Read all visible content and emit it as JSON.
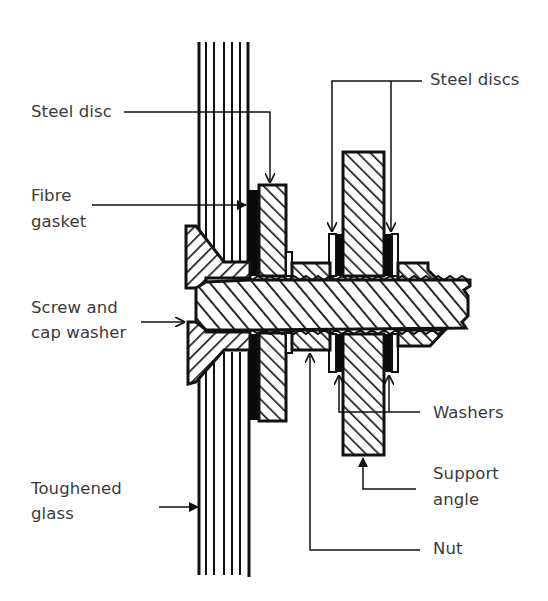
{
  "diagram": {
    "type": "engineering cross-section",
    "colors": {
      "ink": "#111111",
      "text": "#3a3a3a",
      "background": "#ffffff",
      "hatch": "#111111",
      "gasket": "#0a0a0a"
    }
  },
  "labels": {
    "steel_disc": "Steel disc",
    "fibre_gasket_1": "Fibre",
    "fibre_gasket_2": "gasket",
    "screw_1": "Screw and",
    "screw_2": "cap washer",
    "glass_1": "Toughened",
    "glass_2": "glass",
    "steel_discs": "Steel discs",
    "washers": "Washers",
    "support_1": "Support",
    "support_2": "angle",
    "nut": "Nut"
  },
  "components": [
    {
      "id": "toughened-glass",
      "name": "Toughened glass"
    },
    {
      "id": "screw-cap-washer",
      "name": "Screw and cap washer"
    },
    {
      "id": "fibre-gasket",
      "name": "Fibre gasket"
    },
    {
      "id": "steel-disc",
      "name": "Steel disc"
    },
    {
      "id": "nut",
      "name": "Nut"
    },
    {
      "id": "steel-discs",
      "name": "Steel discs"
    },
    {
      "id": "washers",
      "name": "Washers"
    },
    {
      "id": "support-angle",
      "name": "Support angle"
    }
  ]
}
